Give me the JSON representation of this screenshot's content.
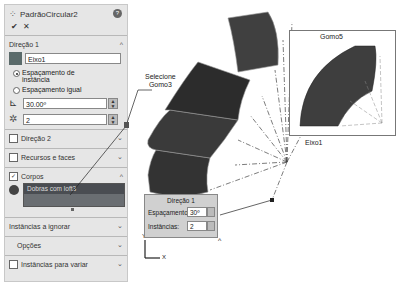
{
  "panel": {
    "title": "PadrãoCircular2",
    "help_icon": "?",
    "ok_icon": "✔",
    "cancel_icon": "✕",
    "direction1": {
      "header": "Direção 1",
      "axis_value": "Eixo1",
      "radio_options": [
        {
          "label": "Espaçamento de instância",
          "selected": true
        },
        {
          "label": "Espaçamento igual",
          "selected": false
        }
      ],
      "angle_value": "30.00º",
      "instances_value": "2"
    },
    "direction2": {
      "header": "Direção 2",
      "checked": false
    },
    "features_faces": {
      "header": "Recursos e faces",
      "checked": false
    },
    "bodies": {
      "header": "Corpos",
      "checked": true,
      "selected_body": "Dobras com loft3"
    },
    "instances_skip": {
      "header": "Instâncias a ignorar"
    },
    "options": {
      "header": "Opções"
    },
    "instances_vary": {
      "header": "Instâncias para variar",
      "checked": false
    }
  },
  "viewport": {
    "callout_select": [
      "Selecione",
      "Gomo3"
    ],
    "axis_label": "Eixo1",
    "inset_label": "Gomo5",
    "popup": {
      "title": "Direção 1",
      "spacing_label": "Espaçamento:",
      "spacing_value": "30º",
      "instances_label": "Instâncias:",
      "instances_value": "2"
    },
    "triad": {
      "y": "Y",
      "x": "X"
    }
  },
  "colors": {
    "panel_bg": "#e6e6e6",
    "body_list": "#4a4d52",
    "part_dark": "#3a3a3a"
  }
}
